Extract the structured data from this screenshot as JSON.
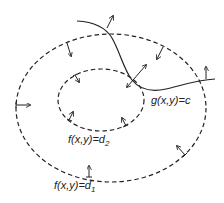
{
  "diagram": {
    "type": "level-sets-with-constraint",
    "colors": {
      "background": "#ffffff",
      "stroke": "#222222"
    },
    "labels": {
      "constraint": "g(x,y)=c",
      "inner_level_prefix": "f(x,y)=d",
      "inner_level_sub": "2",
      "outer_level_prefix": "f(x,y)=d",
      "outer_level_sub": "1"
    },
    "curves": [
      {
        "id": "outer-level-set",
        "style": "dashed",
        "shape": "ellipse",
        "cx": 111,
        "cy": 108,
        "rx": 95,
        "ry": 74
      },
      {
        "id": "inner-level-set",
        "style": "dashed",
        "shape": "ellipse",
        "cx": 101,
        "cy": 100,
        "rx": 43,
        "ry": 31
      },
      {
        "id": "constraint-curve",
        "style": "solid",
        "shape": "path"
      }
    ],
    "arrows": [
      {
        "id": "g-top-normal",
        "from": [
          107,
          27
        ],
        "to": [
          113,
          16
        ]
      },
      {
        "id": "outer-top-left",
        "from": [
          67,
          43
        ],
        "to": [
          71,
          55
        ]
      },
      {
        "id": "outer-top-right",
        "from": [
          163,
          47
        ],
        "to": [
          157,
          59
        ]
      },
      {
        "id": "g-right-normal",
        "from": [
          206,
          79
        ],
        "to": [
          206,
          67
        ]
      },
      {
        "id": "outer-left",
        "from": [
          16,
          105
        ],
        "to": [
          30,
          105
        ]
      },
      {
        "id": "inner-top-left",
        "from": [
          75,
          76
        ],
        "to": [
          79,
          82
        ]
      },
      {
        "id": "tangent-point-double",
        "from": [
          127,
          87
        ],
        "to": [
          146,
          65
        ]
      },
      {
        "id": "inner-bottom-left",
        "from": [
          69,
          120
        ],
        "to": [
          73,
          112
        ]
      },
      {
        "id": "inner-bottom-right",
        "from": [
          126,
          126
        ],
        "to": [
          122,
          118
        ]
      },
      {
        "id": "outer-bottom-right",
        "from": [
          185,
          155
        ],
        "to": [
          177,
          146
        ]
      },
      {
        "id": "outer-bottom",
        "from": [
          89,
          177
        ],
        "to": [
          89,
          166
        ]
      }
    ]
  }
}
